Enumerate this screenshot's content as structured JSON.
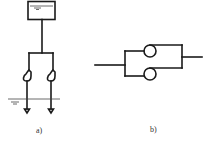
{
  "figure": {
    "panels": [
      {
        "id": "a",
        "caption": "a)",
        "description": "Elevated water tank feeding two parallel pumps submerged below ground water level",
        "components": [
          "tank",
          "supply-pipe",
          "pump-1",
          "pump-2",
          "water-level-line"
        ]
      },
      {
        "id": "b",
        "caption": "b)",
        "description": "Two pumps connected in parallel between inlet and outlet pipes",
        "components": [
          "inlet-pipe",
          "pump-top",
          "pump-bottom",
          "outlet-pipe"
        ]
      }
    ],
    "colors": {
      "stroke": "#1a1a1a",
      "background": "#ffffff",
      "label": "#333333"
    }
  }
}
